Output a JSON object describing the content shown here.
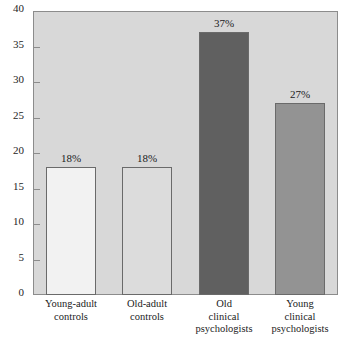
{
  "chart_data": {
    "type": "bar",
    "title": "",
    "subtitle": "",
    "xlabel": "",
    "ylabel": "",
    "ylim": [
      0,
      40
    ],
    "yticks": [
      0,
      5,
      10,
      15,
      20,
      25,
      30,
      35,
      40
    ],
    "ytick_labels": [
      "0",
      "5",
      "10",
      "15",
      "20",
      "25",
      "30",
      "35",
      "40"
    ],
    "grid": false,
    "legend": "none",
    "categories": [
      [
        "Young-adult",
        "controls"
      ],
      [
        "Old-adult",
        "controls"
      ],
      [
        "Old",
        "clinical",
        "psychologists"
      ],
      [
        "Young",
        "clinical",
        "psychologists"
      ]
    ],
    "values": [
      18,
      18,
      37,
      27
    ],
    "data_labels": [
      "18%",
      "18%",
      "37%",
      "27%"
    ],
    "bar_colors": [
      "#f2f2f2",
      "#dcdcdc",
      "#606060",
      "#939393"
    ],
    "bar_edge_color": "#6a6a6a",
    "plot_background": "#d8d8d8",
    "page_background": "#ffffff",
    "axis_color": "#8c8c8c"
  }
}
